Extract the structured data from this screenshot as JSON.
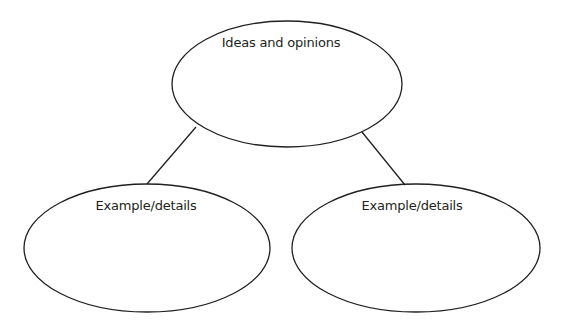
{
  "diagram": {
    "type": "concept-map",
    "stroke_color": "#231f20",
    "nodes": [
      {
        "id": "top",
        "label": "Ideas and opinions"
      },
      {
        "id": "left",
        "label": "Example/details"
      },
      {
        "id": "right",
        "label": "Example/details"
      }
    ],
    "edges": [
      {
        "from": "top",
        "to": "left"
      },
      {
        "from": "top",
        "to": "right"
      }
    ]
  }
}
